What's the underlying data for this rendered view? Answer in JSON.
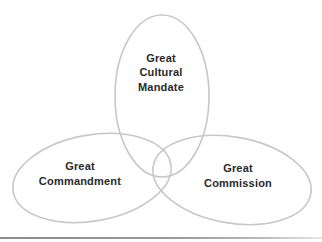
{
  "diagram": {
    "type": "three-overlapping-ellipses",
    "stroke_color": "#c8c8c8",
    "text_color": "#2a2a2a",
    "circles": [
      {
        "id": "top",
        "lines": [
          "Great",
          "Cultural",
          "Mandate"
        ]
      },
      {
        "id": "left",
        "lines": [
          "Great",
          "Commandment"
        ]
      },
      {
        "id": "right",
        "lines": [
          "Great",
          "Commission"
        ]
      }
    ]
  }
}
